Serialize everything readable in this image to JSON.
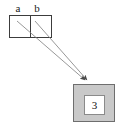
{
  "diagram": {
    "type": "memory-reference-diagram",
    "variables": [
      {
        "name": "a",
        "label": "a"
      },
      {
        "name": "b",
        "label": "b"
      }
    ],
    "object": {
      "value": "3"
    },
    "arrows": [
      {
        "from": "a",
        "to": "object"
      },
      {
        "from": "b",
        "to": "object"
      }
    ],
    "colors": {
      "object_fill": "#c9c9c9",
      "object_border": "#6e6e6e",
      "value_fill": "#ffffff",
      "value_border": "#8a8a8a",
      "frame_border": "#3c3c3c",
      "arrow": "#707070",
      "text": "#1a1a1a",
      "background": "#ffffff"
    }
  }
}
